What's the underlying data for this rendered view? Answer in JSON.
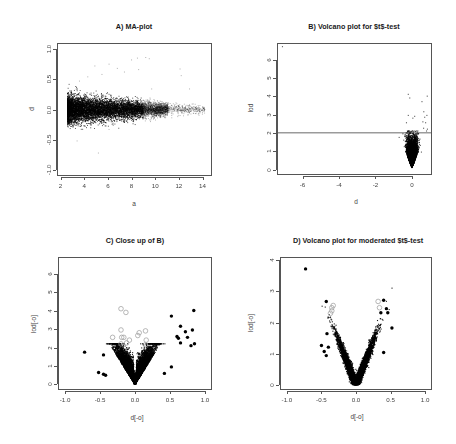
{
  "figure": {
    "width": 456,
    "height": 444,
    "panels": [
      "A",
      "B",
      "C",
      "D"
    ]
  },
  "chart_data": [
    {
      "id": "A",
      "type": "scatter",
      "title": "A) MA-plot",
      "xlabel": "a",
      "ylabel": "d",
      "xlim": [
        1.7,
        14.8
      ],
      "ylim": [
        -1.1,
        1.1
      ],
      "xticks": [
        2,
        4,
        6,
        8,
        10,
        12,
        14
      ],
      "xtick_labels": [
        "2",
        "4",
        "6",
        "8",
        "10",
        "12",
        "14"
      ],
      "yticks": [
        -1.0,
        -0.5,
        0.0,
        0.5,
        1.0
      ],
      "ytick_labels": [
        "-1.0",
        "-0.5",
        "0.0",
        "0.5",
        "1.0"
      ],
      "grid": false,
      "legend": null,
      "cloud": {
        "n": 9000,
        "x_range": [
          2.6,
          14.2
        ],
        "x_density_peak": 4.5,
        "y_center": 0.0,
        "y_sd_at_low_a": 0.11,
        "y_sd_at_high_a": 0.03,
        "point_color": "#000000"
      },
      "outliers": [
        {
          "x": 4.9,
          "y": 0.72
        },
        {
          "x": 6.1,
          "y": 0.75
        },
        {
          "x": 6.8,
          "y": 0.68
        },
        {
          "x": 8.0,
          "y": 0.82
        },
        {
          "x": 8.5,
          "y": 0.85
        },
        {
          "x": 9.2,
          "y": 0.86
        },
        {
          "x": 9.5,
          "y": 0.84
        },
        {
          "x": 8.6,
          "y": 0.66
        },
        {
          "x": 7.4,
          "y": 0.62
        },
        {
          "x": 12.1,
          "y": 0.67
        },
        {
          "x": 12.2,
          "y": 0.56
        },
        {
          "x": 5.5,
          "y": 0.58
        },
        {
          "x": 4.3,
          "y": 0.54
        },
        {
          "x": 3.6,
          "y": 0.47
        },
        {
          "x": 12.9,
          "y": 0.34
        },
        {
          "x": 9.7,
          "y": 0.34
        },
        {
          "x": 5.2,
          "y": -0.72
        },
        {
          "x": 3.4,
          "y": -0.52
        },
        {
          "x": 9.6,
          "y": -0.2
        },
        {
          "x": 12.1,
          "y": -0.1
        },
        {
          "x": 6.1,
          "y": -0.33
        }
      ]
    },
    {
      "id": "B",
      "type": "scatter",
      "title": "B) Volcano plot for $t$-test",
      "xlabel": "d",
      "ylabel": "lod",
      "xlim": [
        -7.4,
        1.1
      ],
      "ylim": [
        -0.3,
        6.9
      ],
      "xticks": [
        -6,
        -4,
        -2,
        0
      ],
      "xtick_labels": [
        "-6",
        "-4",
        "-2",
        "0"
      ],
      "yticks": [
        0,
        1,
        2,
        3,
        4,
        5,
        6
      ],
      "ytick_labels": [
        "0",
        "1",
        "2",
        "3",
        "4",
        "5",
        "6"
      ],
      "hline": 2,
      "grid": false,
      "legend": null,
      "cloud": {
        "n": 7000,
        "x_sd": 0.12,
        "lod_max": 2.1,
        "point_color": "#000000"
      },
      "outliers": [
        {
          "x": -7.1,
          "y": 6.7
        },
        {
          "x": -0.2,
          "y": 4.1
        },
        {
          "x": -0.12,
          "y": 3.9
        },
        {
          "x": 0.55,
          "y": 3.7
        },
        {
          "x": 0.84,
          "y": 4.0
        },
        {
          "x": 0.82,
          "y": 2.95
        },
        {
          "x": 0.65,
          "y": 3.15
        },
        {
          "x": 0.7,
          "y": 2.85
        },
        {
          "x": 0.6,
          "y": 2.6
        },
        {
          "x": 0.75,
          "y": 2.55
        },
        {
          "x": 0.64,
          "y": 2.25
        },
        {
          "x": 0.85,
          "y": 2.2
        },
        {
          "x": 0.8,
          "y": 2.1
        },
        {
          "x": -0.2,
          "y": 2.95
        },
        {
          "x": 0.15,
          "y": 2.9
        },
        {
          "x": -0.3,
          "y": 2.55
        },
        {
          "x": 0.05,
          "y": 2.8
        },
        {
          "x": -0.7,
          "y": 1.75
        },
        {
          "x": -0.45,
          "y": 1.6
        },
        {
          "x": 0.4,
          "y": 1.6
        },
        {
          "x": 0.52,
          "y": 0.95
        }
      ]
    },
    {
      "id": "C",
      "type": "scatter",
      "title": "C) Close up of B)",
      "xlabel": "d[-o]",
      "ylabel": "lod[-o]",
      "xlim": [
        -1.1,
        1.1
      ],
      "ylim": [
        -0.3,
        6.9
      ],
      "xticks": [
        -1.0,
        -0.5,
        0.0,
        0.5,
        1.0
      ],
      "xtick_labels": [
        "-1.0",
        "-0.5",
        "0.0",
        "0.5",
        "1.0"
      ],
      "yticks": [
        0,
        1,
        2,
        3,
        4,
        5,
        6
      ],
      "ytick_labels": [
        "0",
        "1",
        "2",
        "3",
        "4",
        "5",
        "6"
      ],
      "grid": false,
      "legend": null,
      "cloud": {
        "n": 8000,
        "x_sd": 0.12,
        "lod_max": 2.2,
        "point_color": "#000000"
      },
      "highlight_filled": [
        {
          "x": -0.72,
          "y": 1.75
        },
        {
          "x": 0.52,
          "y": 3.7
        },
        {
          "x": 0.84,
          "y": 4.0
        },
        {
          "x": 0.65,
          "y": 3.15
        },
        {
          "x": 0.72,
          "y": 2.85
        },
        {
          "x": 0.82,
          "y": 2.95
        },
        {
          "x": 0.6,
          "y": 2.6
        },
        {
          "x": 0.62,
          "y": 2.5
        },
        {
          "x": 0.75,
          "y": 2.55
        },
        {
          "x": 0.65,
          "y": 2.25
        },
        {
          "x": 0.85,
          "y": 2.2
        },
        {
          "x": 0.8,
          "y": 2.1
        },
        {
          "x": -0.45,
          "y": 1.6
        },
        {
          "x": -0.52,
          "y": 0.65
        },
        {
          "x": -0.45,
          "y": 0.55
        },
        {
          "x": -0.42,
          "y": 0.5
        },
        {
          "x": 0.42,
          "y": 0.6
        },
        {
          "x": 0.52,
          "y": 0.95
        }
      ],
      "highlight_open": [
        {
          "x": -0.2,
          "y": 4.1
        },
        {
          "x": -0.13,
          "y": 3.9
        },
        {
          "x": -0.2,
          "y": 2.95
        },
        {
          "x": 0.15,
          "y": 2.9
        },
        {
          "x": -0.32,
          "y": 2.55
        },
        {
          "x": -0.19,
          "y": 2.55
        },
        {
          "x": -0.16,
          "y": 2.55
        },
        {
          "x": -0.08,
          "y": 2.4
        },
        {
          "x": 0.06,
          "y": 2.8
        },
        {
          "x": 0.04,
          "y": 2.65
        },
        {
          "x": 0.16,
          "y": 2.4
        },
        {
          "x": -0.12,
          "y": 2.25
        },
        {
          "x": -0.2,
          "y": 2.2
        },
        {
          "x": 0.15,
          "y": 2.15
        }
      ]
    },
    {
      "id": "D",
      "type": "scatter",
      "title": "D) Volcano plot for moderated $t$-test",
      "xlabel": "d[-o]",
      "ylabel": "lod[-o]",
      "xlim": [
        -1.1,
        1.1
      ],
      "ylim": [
        -0.15,
        4.1
      ],
      "xticks": [
        -1.0,
        -0.5,
        0.0,
        0.5,
        1.0
      ],
      "xtick_labels": [
        "-1.0",
        "-0.5",
        "0.0",
        "0.5",
        "1.0"
      ],
      "yticks": [
        0,
        1,
        2,
        3,
        4
      ],
      "ytick_labels": [
        "0",
        "1",
        "2",
        "3",
        "4"
      ],
      "grid": false,
      "legend": null,
      "cloud": {
        "n": 8000,
        "slope_lod_per_d": 5.6,
        "x_sd": 0.12,
        "point_color": "#000000"
      },
      "highlight_filled": [
        {
          "x": -0.73,
          "y": 3.72
        },
        {
          "x": -0.43,
          "y": 2.68
        },
        {
          "x": 0.4,
          "y": 2.72
        },
        {
          "x": 0.44,
          "y": 2.45
        },
        {
          "x": 0.46,
          "y": 2.32
        },
        {
          "x": 0.36,
          "y": 2.32
        },
        {
          "x": 0.52,
          "y": 1.83
        },
        {
          "x": -0.5,
          "y": 1.27
        },
        {
          "x": -0.46,
          "y": 1.08
        },
        {
          "x": -0.43,
          "y": 0.95
        },
        {
          "x": -0.4,
          "y": 1.22
        },
        {
          "x": 0.4,
          "y": 1.05
        },
        {
          "x": -0.42,
          "y": 1.65
        }
      ],
      "highlight_open": [
        {
          "x": -0.33,
          "y": 2.55
        },
        {
          "x": -0.35,
          "y": 2.48
        },
        {
          "x": -0.35,
          "y": 2.38
        },
        {
          "x": -0.37,
          "y": 2.3
        },
        {
          "x": 0.32,
          "y": 2.68
        },
        {
          "x": 0.34,
          "y": 2.48
        }
      ]
    }
  ],
  "panels": {
    "A": {
      "title": "A) MA-plot",
      "xlabel": "a",
      "ylabel": "d"
    },
    "B": {
      "title": "B) Volcano plot for $t$-test",
      "xlabel": "d",
      "ylabel": "lod"
    },
    "C": {
      "title": "C) Close up of B)",
      "xlabel": "d[-o]",
      "ylabel": "lod[-o]"
    },
    "D": {
      "title": "D) Volcano plot for moderated $t$-test",
      "xlabel": "d[-o]",
      "ylabel": "lod[-o]"
    }
  },
  "colors": {
    "points": "#000000",
    "open_circles": "#9a9a9a",
    "axes": "#555555",
    "text": "#333333"
  }
}
